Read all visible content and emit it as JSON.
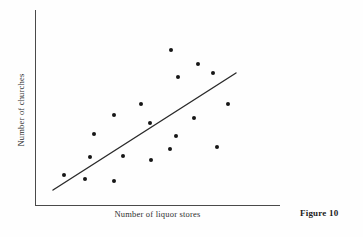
{
  "figure": {
    "caption": "Figure 10",
    "background_color": "#fefefe",
    "ink_color": "#161616",
    "axis_color": "#4a4a4a"
  },
  "chart_data": {
    "type": "scatter",
    "title": "",
    "xlabel": "Number of liquor stores",
    "ylabel": "Number of churches",
    "grid": false,
    "legend": false,
    "axis_ticks": false,
    "axis_tick_labels": [],
    "xlim": [
      35,
      280
    ],
    "ylim": [
      10,
      205
    ],
    "note": "Unlabeled axes; values are pixel positions within the plot frame. Positive association shown with an overlaid straight trend line.",
    "points": [
      {
        "x": 171,
        "y": 50
      },
      {
        "x": 198,
        "y": 64
      },
      {
        "x": 178,
        "y": 77
      },
      {
        "x": 213,
        "y": 73
      },
      {
        "x": 141,
        "y": 104
      },
      {
        "x": 228,
        "y": 104
      },
      {
        "x": 114,
        "y": 115
      },
      {
        "x": 150,
        "y": 123
      },
      {
        "x": 194,
        "y": 118
      },
      {
        "x": 94,
        "y": 134
      },
      {
        "x": 176,
        "y": 136
      },
      {
        "x": 217,
        "y": 147
      },
      {
        "x": 123,
        "y": 156
      },
      {
        "x": 170,
        "y": 149
      },
      {
        "x": 90,
        "y": 157
      },
      {
        "x": 151,
        "y": 160
      },
      {
        "x": 64,
        "y": 175
      },
      {
        "x": 85,
        "y": 179
      },
      {
        "x": 114,
        "y": 181
      }
    ],
    "trend_line": {
      "x1": 53,
      "y1": 190,
      "x2": 236,
      "y2": 73,
      "color": "#2a2a2a",
      "width": 1.4
    }
  }
}
